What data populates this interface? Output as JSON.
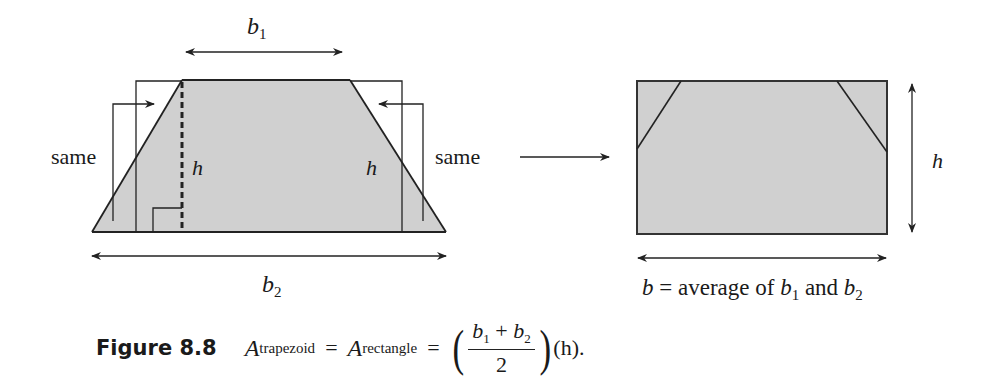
{
  "figure": {
    "label": "Figure 8.8",
    "colors": {
      "fill": "#d0d0d0",
      "stroke": "#2a2a2a"
    },
    "trapezoid": {
      "top_label": "b",
      "top_label_sub": "1",
      "bottom_label": "b",
      "bottom_label_sub": "2",
      "height_label_inner": "h",
      "height_label_right": "h",
      "left_annotation": "same",
      "right_annotation": "same"
    },
    "rectangle": {
      "height_label": "h",
      "base_caption": {
        "b": "b",
        "eq": " = average of ",
        "b1": "b",
        "b1_sub": "1",
        "and": " and ",
        "b2": "b",
        "b2_sub": "2"
      }
    },
    "equation": {
      "A1": "A",
      "A1_sub": "trapezoid",
      "equals1": "=",
      "A2": "A",
      "A2_sub": "rectangle",
      "equals2": "=",
      "num_b1": "b",
      "num_b1_sub": "1",
      "num_plus": "+",
      "num_b2": "b",
      "num_b2_sub": "2",
      "den": "2",
      "tail": "(h)."
    }
  }
}
